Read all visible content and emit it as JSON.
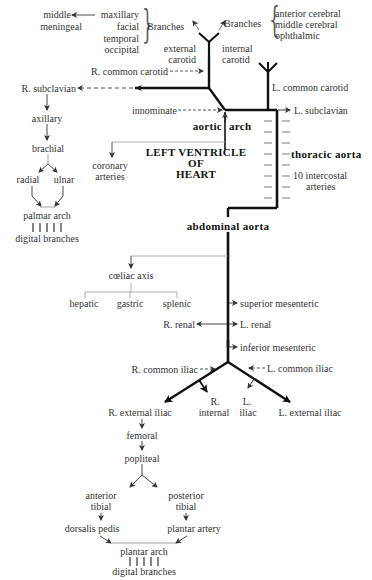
{
  "diagram": {
    "type": "arterial-system-flowchart",
    "head": {
      "external_carotid_branches": [
        "maxillary",
        "facial",
        "temporal",
        "occipital"
      ],
      "external_carotid_branches_label": "Branches",
      "maxillary_sub": "middle meningeal",
      "maxillary_sub_lines": [
        "middle",
        "meningeal"
      ],
      "internal_carotid_branches": [
        "anterior cerebral",
        "middle cerebral",
        "ophthalmic"
      ],
      "internal_carotid_branches_label": "Branches",
      "external_carotid": [
        "external",
        "carotid"
      ],
      "internal_carotid": [
        "internal",
        "carotid"
      ],
      "r_common_carotid": "R. common carotid",
      "l_common_carotid": "L. common carotid"
    },
    "arch": {
      "r_subclavian": "R. subclavian",
      "l_subclavian": "L. subclavian",
      "innominate": "innominate",
      "aortic_arch": [
        "aortic",
        "arch"
      ],
      "left_ventricle": [
        "LEFT VENTRICLE",
        "OF",
        "HEART"
      ],
      "coronary": [
        "coronary",
        "arteries"
      ]
    },
    "arm": {
      "axillary": "axillary",
      "brachial": "brachial",
      "radial": "radial",
      "ulnar": "ulnar",
      "palmar_arch": "palmar arch",
      "digital_branches": "digital branches"
    },
    "thorax": {
      "thoracic_aorta": "thoracic aorta",
      "intercostal": [
        "10 intercostal",
        "arteries"
      ]
    },
    "abdomen": {
      "abdominal_aorta": "abdominal aorta",
      "coeliac_axis": "cœliac axis",
      "coeliac_branches": [
        "hepatic",
        "gastric",
        "splenic"
      ],
      "superior_mesenteric": "superior mesenteric",
      "r_renal": "R. renal",
      "l_renal": "L. renal",
      "inferior_mesenteric": "inferior mesenteric",
      "r_common_iliac": "R. common iliac",
      "l_common_iliac": "L. common iliac"
    },
    "pelvis": {
      "r_external_iliac": "R. external iliac",
      "internal_iliac_r": "R.",
      "internal_iliac_l": "L.",
      "internal": "internal",
      "iliac": "iliac",
      "l_external_iliac": "L. external iliac"
    },
    "leg": {
      "femoral": "femoral",
      "popliteal": "popliteal",
      "anterior_tibial": [
        "anterior",
        "tibial"
      ],
      "posterior_tibial": [
        "posterior",
        "tibial"
      ],
      "dorsalis_pedis": "dorsalis pedis",
      "plantar_artery": "plantar artery",
      "plantar_arch": "plantar arch",
      "digital_branches": "digital branches"
    }
  }
}
